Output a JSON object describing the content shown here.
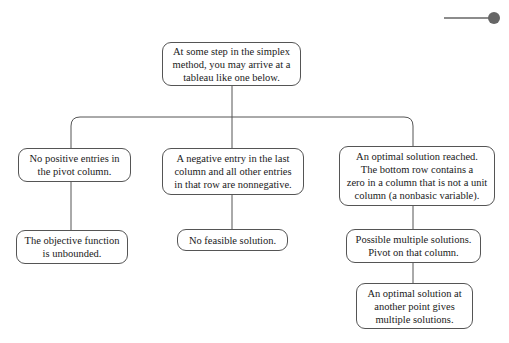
{
  "diagram": {
    "type": "flowchart",
    "root": {
      "id": "start",
      "text": "At some step in the simplex\nmethod, you may arrive at a\ntableau like one below."
    },
    "branches": [
      {
        "id": "no-positive",
        "text": "No positive entries in\nthe pivot column.",
        "children": [
          {
            "id": "unbounded",
            "text": "The objective function\nis unbounded."
          }
        ]
      },
      {
        "id": "negative-entry",
        "text": "A negative entry in the last\ncolumn and all other entries\nin that row are nonnegative.",
        "children": [
          {
            "id": "infeasible",
            "text": "No feasible solution."
          }
        ]
      },
      {
        "id": "optimal-reached",
        "text": "An optimal solution reached.\nThe bottom row contains a\nzero in a column that is not a unit\ncolumn (a nonbasic variable).",
        "children": [
          {
            "id": "multiple-possible",
            "text": "Possible multiple solutions.\nPivot on that column."
          },
          {
            "id": "multiple-solutions",
            "text": "An optimal solution at\nanother point gives\nmultiple solutions."
          }
        ]
      }
    ],
    "colors": {
      "stroke": "#555555",
      "text": "#1a1a1a",
      "background": "#ffffff",
      "marker": "#666666"
    }
  }
}
